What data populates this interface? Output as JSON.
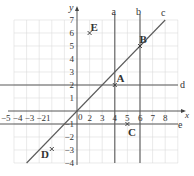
{
  "diagram": {
    "axes": {
      "x_label": "x",
      "y_label": "y",
      "x_ticks": [
        "−5",
        "−4",
        "−3",
        "−2",
        "1",
        "0",
        "1",
        "2",
        "3",
        "4",
        "5",
        "6",
        "7",
        "8"
      ],
      "x_tick_text": "−5 −4 −3 −21",
      "origin_label": "0",
      "y_ticks": [
        "7",
        "6",
        "5",
        "4",
        "3",
        "2",
        "1",
        "−1",
        "−2",
        "−3",
        "−4"
      ]
    },
    "points": [
      {
        "label": "A",
        "x": 3,
        "y": 2
      },
      {
        "label": "B",
        "x": 5,
        "y": 5
      },
      {
        "label": "C",
        "x": 4,
        "y": -1
      },
      {
        "label": "D",
        "x": -2,
        "y": -3
      },
      {
        "label": "E",
        "x": 1,
        "y": 6
      }
    ],
    "lines": [
      {
        "label": "a",
        "equation": "x = 3"
      },
      {
        "label": "b",
        "equation": "x = 5"
      },
      {
        "label": "c",
        "equation": "y = x"
      },
      {
        "label": "d",
        "equation": "y = 2"
      },
      {
        "label": "e",
        "equation": "y = -1"
      }
    ],
    "colors": {
      "grid": "#dcdcdc",
      "line": "#555555",
      "text": "#333333"
    }
  }
}
